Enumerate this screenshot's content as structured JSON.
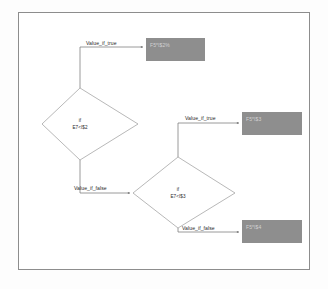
{
  "diagram": {
    "frame": {
      "border_color": "#8d8d8d",
      "background_color": "#ffffff"
    },
    "colors": {
      "process_box_fill": "#8e8e8e",
      "process_box_text": "#d2d2d2",
      "connector": "#7a7a7a",
      "decision_stroke": "#9a9a9a",
      "decision_fill": "#ffffff",
      "label_text": "#1f1f1f"
    },
    "decisions": [
      {
        "id": "decision-1",
        "keyword": "if",
        "condition": "E7<I$2"
      },
      {
        "id": "decision-2",
        "keyword": "if",
        "condition": "E7<I$3"
      }
    ],
    "edges": [
      {
        "id": "edge-true-1",
        "label": "Value_if_true",
        "from": "decision-1",
        "to": "result-1"
      },
      {
        "id": "edge-false-1",
        "label": "Value_if_false",
        "from": "decision-1",
        "to": "decision-2"
      },
      {
        "id": "edge-true-2",
        "label": "Value_if_true",
        "from": "decision-2",
        "to": "result-2"
      },
      {
        "id": "edge-false-2",
        "label": "Value_if_false",
        "from": "decision-2",
        "to": "result-3"
      }
    ],
    "results": [
      {
        "id": "result-1",
        "text": "F5*I$2%"
      },
      {
        "id": "result-2",
        "text": "F5*I$3"
      },
      {
        "id": "result-3",
        "text": "F5*I$4"
      }
    ]
  }
}
